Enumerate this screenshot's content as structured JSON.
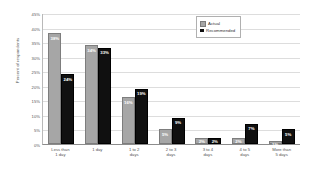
{
  "chart_data": {
    "type": "bar",
    "title": "",
    "xlabel": "",
    "ylabel": "Percent of respondents",
    "ylim": [
      0,
      45
    ],
    "ytick_labels": [
      "45%",
      "40%",
      "35%",
      "30%",
      "25%",
      "20%",
      "15%",
      "10%",
      "5%",
      "0%"
    ],
    "ytick_values": [
      45,
      40,
      35,
      30,
      25,
      20,
      15,
      10,
      5,
      0
    ],
    "grid": true,
    "legend_position": "top-right",
    "categories": [
      "Less than 1 day",
      "1 day",
      "1 to 2 days",
      "2 to 3 days",
      "3 to 4 days",
      "4 to 5 days",
      "More than 5 days"
    ],
    "category_lines": [
      [
        "Less than",
        "1 day"
      ],
      [
        "1 day"
      ],
      [
        "1 to 2",
        "days"
      ],
      [
        "2 to 3",
        "days"
      ],
      [
        "3 to 4",
        "days"
      ],
      [
        "4 to 5",
        "days"
      ],
      [
        "More than",
        "5 days"
      ]
    ],
    "series": [
      {
        "name": "Actual",
        "color": "#a6a6a6",
        "values": [
          38,
          34,
          16,
          5,
          2,
          2,
          1
        ],
        "labels": [
          "38%",
          "34%",
          "16%",
          "5%",
          "2%",
          "2%",
          "1%"
        ]
      },
      {
        "name": "Recommended",
        "color": "#101010",
        "values": [
          24,
          33,
          19,
          9,
          2,
          7,
          5
        ],
        "labels": [
          "24%",
          "33%",
          "19%",
          "9%",
          "2%",
          "7%",
          "5%"
        ]
      }
    ]
  }
}
